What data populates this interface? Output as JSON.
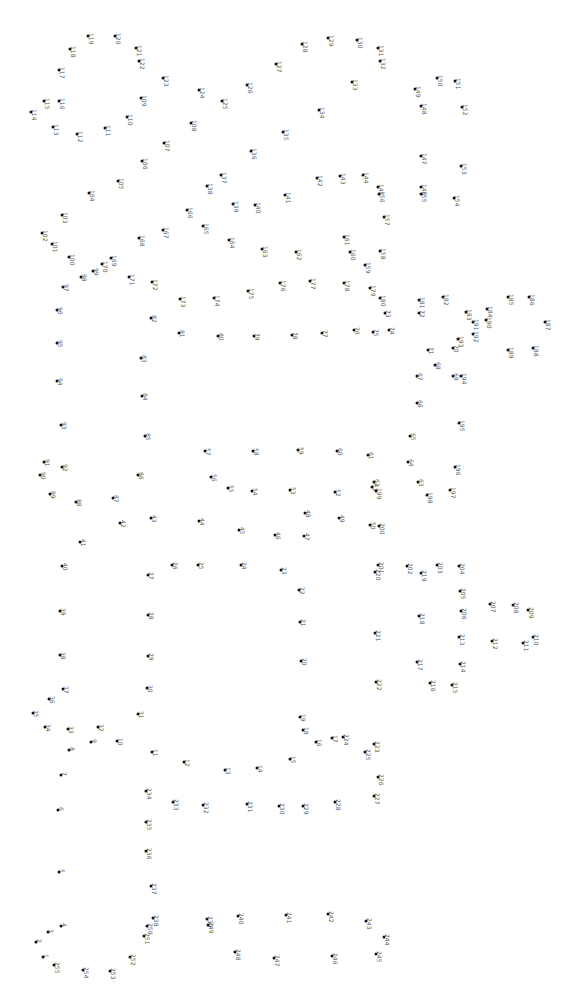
{
  "puzzle": {
    "title": "Connect the dots",
    "rotation_deg": 90,
    "dot_color": "#111111",
    "label_color": "#555555",
    "dots": [
      {
        "n": "1",
        "x": 43,
        "y": 957
      },
      {
        "n": "2",
        "x": 36,
        "y": 942
      },
      {
        "n": "3",
        "x": 48,
        "y": 932
      },
      {
        "n": "4",
        "x": 61,
        "y": 926
      },
      {
        "n": "5",
        "x": 59,
        "y": 872
      },
      {
        "n": "6",
        "x": 58,
        "y": 810
      },
      {
        "n": "7",
        "x": 61,
        "y": 775
      },
      {
        "n": "8",
        "x": 69,
        "y": 750
      },
      {
        "n": "9",
        "x": 91,
        "y": 742
      },
      {
        "n": "10",
        "x": 117,
        "y": 741
      },
      {
        "n": "11",
        "x": 152,
        "y": 752
      },
      {
        "n": "12",
        "x": 184,
        "y": 762
      },
      {
        "n": "13",
        "x": 225,
        "y": 770
      },
      {
        "n": "14",
        "x": 257,
        "y": 768
      },
      {
        "n": "15",
        "x": 290,
        "y": 759
      },
      {
        "n": "16",
        "x": 316,
        "y": 742
      },
      {
        "n": "17",
        "x": 332,
        "y": 738
      },
      {
        "n": "18",
        "x": 303,
        "y": 730
      },
      {
        "n": "19",
        "x": 300,
        "y": 717
      },
      {
        "n": "20",
        "x": 301,
        "y": 661
      },
      {
        "n": "21",
        "x": 300,
        "y": 622
      },
      {
        "n": "22",
        "x": 299,
        "y": 590
      },
      {
        "n": "23",
        "x": 281,
        "y": 570
      },
      {
        "n": "24",
        "x": 241,
        "y": 565
      },
      {
        "n": "25",
        "x": 198,
        "y": 565
      },
      {
        "n": "26",
        "x": 172,
        "y": 565
      },
      {
        "n": "27",
        "x": 148,
        "y": 575
      },
      {
        "n": "28",
        "x": 148,
        "y": 615
      },
      {
        "n": "29",
        "x": 148,
        "y": 656
      },
      {
        "n": "30",
        "x": 147,
        "y": 688
      },
      {
        "n": "31",
        "x": 138,
        "y": 714
      },
      {
        "n": "32",
        "x": 98,
        "y": 727
      },
      {
        "n": "33",
        "x": 68,
        "y": 729
      },
      {
        "n": "34",
        "x": 45,
        "y": 727
      },
      {
        "n": "35",
        "x": 33,
        "y": 713
      },
      {
        "n": "36",
        "x": 49,
        "y": 699
      },
      {
        "n": "37",
        "x": 63,
        "y": 689
      },
      {
        "n": "38",
        "x": 60,
        "y": 655
      },
      {
        "n": "39",
        "x": 60,
        "y": 611
      },
      {
        "n": "40",
        "x": 62,
        "y": 566
      },
      {
        "n": "41",
        "x": 80,
        "y": 542
      },
      {
        "n": "42",
        "x": 120,
        "y": 523
      },
      {
        "n": "43",
        "x": 151,
        "y": 518
      },
      {
        "n": "44",
        "x": 199,
        "y": 521
      },
      {
        "n": "45",
        "x": 239,
        "y": 530
      },
      {
        "n": "46",
        "x": 275,
        "y": 535
      },
      {
        "n": "47",
        "x": 304,
        "y": 536
      },
      {
        "n": "48",
        "x": 305,
        "y": 513
      },
      {
        "n": "49",
        "x": 339,
        "y": 518
      },
      {
        "n": "50",
        "x": 370,
        "y": 525
      },
      {
        "n": "51",
        "x": 372,
        "y": 487
      },
      {
        "n": "52",
        "x": 335,
        "y": 492
      },
      {
        "n": "53",
        "x": 290,
        "y": 490
      },
      {
        "n": "54",
        "x": 252,
        "y": 491
      },
      {
        "n": "55",
        "x": 228,
        "y": 488
      },
      {
        "n": "56",
        "x": 211,
        "y": 477
      },
      {
        "n": "57",
        "x": 205,
        "y": 451
      },
      {
        "n": "58",
        "x": 253,
        "y": 451
      },
      {
        "n": "59",
        "x": 298,
        "y": 450
      },
      {
        "n": "60",
        "x": 337,
        "y": 451
      },
      {
        "n": "61",
        "x": 368,
        "y": 455
      },
      {
        "n": "62",
        "x": 374,
        "y": 482
      },
      {
        "n": "63",
        "x": 418,
        "y": 482
      },
      {
        "n": "64",
        "x": 408,
        "y": 462
      },
      {
        "n": "65",
        "x": 410,
        "y": 436
      },
      {
        "n": "66",
        "x": 417,
        "y": 403
      },
      {
        "n": "67",
        "x": 417,
        "y": 376
      },
      {
        "n": "68",
        "x": 435,
        "y": 365
      },
      {
        "n": "69",
        "x": 453,
        "y": 376
      },
      {
        "n": "70",
        "x": 453,
        "y": 348
      },
      {
        "n": "71",
        "x": 428,
        "y": 350
      },
      {
        "n": "72",
        "x": 419,
        "y": 313
      },
      {
        "n": "73",
        "x": 385,
        "y": 313
      },
      {
        "n": "74",
        "x": 389,
        "y": 330
      },
      {
        "n": "75",
        "x": 373,
        "y": 332
      },
      {
        "n": "76",
        "x": 354,
        "y": 330
      },
      {
        "n": "77",
        "x": 322,
        "y": 333
      },
      {
        "n": "78",
        "x": 292,
        "y": 335
      },
      {
        "n": "79",
        "x": 254,
        "y": 336
      },
      {
        "n": "80",
        "x": 218,
        "y": 336
      },
      {
        "n": "81",
        "x": 179,
        "y": 333
      },
      {
        "n": "82",
        "x": 151,
        "y": 318
      },
      {
        "n": "83",
        "x": 141,
        "y": 358
      },
      {
        "n": "84",
        "x": 142,
        "y": 396
      },
      {
        "n": "85",
        "x": 145,
        "y": 436
      },
      {
        "n": "86",
        "x": 138,
        "y": 475
      },
      {
        "n": "87",
        "x": 113,
        "y": 498
      },
      {
        "n": "88",
        "x": 76,
        "y": 502
      },
      {
        "n": "89",
        "x": 50,
        "y": 494
      },
      {
        "n": "90",
        "x": 40,
        "y": 475
      },
      {
        "n": "91",
        "x": 44,
        "y": 462
      },
      {
        "n": "92",
        "x": 62,
        "y": 467
      },
      {
        "n": "93",
        "x": 61,
        "y": 425
      },
      {
        "n": "94",
        "x": 57,
        "y": 381
      },
      {
        "n": "95",
        "x": 57,
        "y": 343
      },
      {
        "n": "96",
        "x": 57,
        "y": 310
      },
      {
        "n": "97",
        "x": 63,
        "y": 287
      },
      {
        "n": "98",
        "x": 81,
        "y": 277
      },
      {
        "n": "99",
        "x": 93,
        "y": 271
      },
      {
        "n": "100",
        "x": 69,
        "y": 257
      },
      {
        "n": "101",
        "x": 52,
        "y": 244
      },
      {
        "n": "102",
        "x": 42,
        "y": 233
      },
      {
        "n": "103",
        "x": 62,
        "y": 215
      },
      {
        "n": "104",
        "x": 89,
        "y": 193
      },
      {
        "n": "105",
        "x": 118,
        "y": 181
      },
      {
        "n": "106",
        "x": 142,
        "y": 161
      },
      {
        "n": "107",
        "x": 164,
        "y": 143
      },
      {
        "n": "108",
        "x": 191,
        "y": 123
      },
      {
        "n": "109",
        "x": 141,
        "y": 98
      },
      {
        "n": "110",
        "x": 127,
        "y": 117
      },
      {
        "n": "111",
        "x": 105,
        "y": 128
      },
      {
        "n": "112",
        "x": 77,
        "y": 134
      },
      {
        "n": "113",
        "x": 53,
        "y": 127
      },
      {
        "n": "114",
        "x": 31,
        "y": 112
      },
      {
        "n": "115",
        "x": 44,
        "y": 101
      },
      {
        "n": "116",
        "x": 59,
        "y": 101
      },
      {
        "n": "117",
        "x": 59,
        "y": 70
      },
      {
        "n": "118",
        "x": 70,
        "y": 49
      },
      {
        "n": "119",
        "x": 88,
        "y": 36
      },
      {
        "n": "120",
        "x": 115,
        "y": 36
      },
      {
        "n": "121",
        "x": 136,
        "y": 48
      },
      {
        "n": "122",
        "x": 139,
        "y": 61
      },
      {
        "n": "123",
        "x": 163,
        "y": 78
      },
      {
        "n": "124",
        "x": 199,
        "y": 90
      },
      {
        "n": "125",
        "x": 222,
        "y": 101
      },
      {
        "n": "126",
        "x": 247,
        "y": 85
      },
      {
        "n": "127",
        "x": 276,
        "y": 64
      },
      {
        "n": "128",
        "x": 302,
        "y": 44
      },
      {
        "n": "129",
        "x": 328,
        "y": 38
      },
      {
        "n": "130",
        "x": 357,
        "y": 40
      },
      {
        "n": "131",
        "x": 378,
        "y": 48
      },
      {
        "n": "132",
        "x": 380,
        "y": 61
      },
      {
        "n": "133",
        "x": 352,
        "y": 82
      },
      {
        "n": "134",
        "x": 319,
        "y": 110
      },
      {
        "n": "135",
        "x": 283,
        "y": 132
      },
      {
        "n": "136",
        "x": 251,
        "y": 151
      },
      {
        "n": "137",
        "x": 221,
        "y": 175
      },
      {
        "n": "138",
        "x": 207,
        "y": 186
      },
      {
        "n": "139",
        "x": 233,
        "y": 204
      },
      {
        "n": "140",
        "x": 255,
        "y": 205
      },
      {
        "n": "141",
        "x": 285,
        "y": 195
      },
      {
        "n": "142",
        "x": 317,
        "y": 178
      },
      {
        "n": "143",
        "x": 340,
        "y": 176
      },
      {
        "n": "144",
        "x": 363,
        "y": 175
      },
      {
        "n": "145",
        "x": 378,
        "y": 187
      },
      {
        "n": "146",
        "x": 421,
        "y": 187
      },
      {
        "n": "147",
        "x": 421,
        "y": 156
      },
      {
        "n": "148",
        "x": 421,
        "y": 106
      },
      {
        "n": "149",
        "x": 415,
        "y": 89
      },
      {
        "n": "150",
        "x": 437,
        "y": 78
      },
      {
        "n": "151",
        "x": 455,
        "y": 81
      },
      {
        "n": "152",
        "x": 462,
        "y": 107
      },
      {
        "n": "153",
        "x": 461,
        "y": 166
      },
      {
        "n": "154",
        "x": 454,
        "y": 198
      },
      {
        "n": "155",
        "x": 421,
        "y": 194
      },
      {
        "n": "156",
        "x": 379,
        "y": 194
      },
      {
        "n": "157",
        "x": 384,
        "y": 217
      },
      {
        "n": "158",
        "x": 380,
        "y": 251
      },
      {
        "n": "159",
        "x": 365,
        "y": 265
      },
      {
        "n": "160",
        "x": 350,
        "y": 252
      },
      {
        "n": "161",
        "x": 344,
        "y": 237
      },
      {
        "n": "162",
        "x": 296,
        "y": 252
      },
      {
        "n": "163",
        "x": 262,
        "y": 249
      },
      {
        "n": "164",
        "x": 229,
        "y": 240
      },
      {
        "n": "165",
        "x": 203,
        "y": 226
      },
      {
        "n": "166",
        "x": 187,
        "y": 210
      },
      {
        "n": "167",
        "x": 163,
        "y": 230
      },
      {
        "n": "168",
        "x": 139,
        "y": 238
      },
      {
        "n": "169",
        "x": 111,
        "y": 258
      },
      {
        "n": "170",
        "x": 102,
        "y": 264
      },
      {
        "n": "171",
        "x": 129,
        "y": 277
      },
      {
        "n": "172",
        "x": 152,
        "y": 282
      },
      {
        "n": "173",
        "x": 180,
        "y": 299
      },
      {
        "n": "174",
        "x": 214,
        "y": 298
      },
      {
        "n": "175",
        "x": 248,
        "y": 291
      },
      {
        "n": "176",
        "x": 280,
        "y": 283
      },
      {
        "n": "177",
        "x": 310,
        "y": 281
      },
      {
        "n": "178",
        "x": 344,
        "y": 283
      },
      {
        "n": "179",
        "x": 370,
        "y": 288
      },
      {
        "n": "180",
        "x": 380,
        "y": 298
      },
      {
        "n": "181",
        "x": 419,
        "y": 300
      },
      {
        "n": "182",
        "x": 443,
        "y": 297
      },
      {
        "n": "183",
        "x": 466,
        "y": 312
      },
      {
        "n": "184",
        "x": 487,
        "y": 309
      },
      {
        "n": "185",
        "x": 508,
        "y": 297
      },
      {
        "n": "186",
        "x": 529,
        "y": 297
      },
      {
        "n": "187",
        "x": 545,
        "y": 322
      },
      {
        "n": "188",
        "x": 533,
        "y": 348
      },
      {
        "n": "189",
        "x": 508,
        "y": 350
      },
      {
        "n": "190",
        "x": 486,
        "y": 320
      },
      {
        "n": "191",
        "x": 473,
        "y": 322
      },
      {
        "n": "192",
        "x": 473,
        "y": 334
      },
      {
        "n": "193",
        "x": 458,
        "y": 339
      },
      {
        "n": "194",
        "x": 461,
        "y": 376
      },
      {
        "n": "195",
        "x": 459,
        "y": 423
      },
      {
        "n": "196",
        "x": 455,
        "y": 467
      },
      {
        "n": "197",
        "x": 450,
        "y": 490
      },
      {
        "n": "198",
        "x": 427,
        "y": 495
      },
      {
        "n": "199",
        "x": 376,
        "y": 491
      },
      {
        "n": "200",
        "x": 379,
        "y": 526
      },
      {
        "n": "201",
        "x": 378,
        "y": 565
      },
      {
        "n": "202",
        "x": 407,
        "y": 566
      },
      {
        "n": "203",
        "x": 437,
        "y": 565
      },
      {
        "n": "204",
        "x": 459,
        "y": 566
      },
      {
        "n": "205",
        "x": 460,
        "y": 591
      },
      {
        "n": "206",
        "x": 461,
        "y": 611
      },
      {
        "n": "207",
        "x": 490,
        "y": 604
      },
      {
        "n": "208",
        "x": 513,
        "y": 605
      },
      {
        "n": "209",
        "x": 528,
        "y": 610
      },
      {
        "n": "210",
        "x": 533,
        "y": 637
      },
      {
        "n": "211",
        "x": 523,
        "y": 643
      },
      {
        "n": "212",
        "x": 492,
        "y": 641
      },
      {
        "n": "213",
        "x": 459,
        "y": 637
      },
      {
        "n": "214",
        "x": 460,
        "y": 664
      },
      {
        "n": "215",
        "x": 452,
        "y": 685
      },
      {
        "n": "216",
        "x": 430,
        "y": 683
      },
      {
        "n": "217",
        "x": 417,
        "y": 662
      },
      {
        "n": "218",
        "x": 419,
        "y": 616
      },
      {
        "n": "219",
        "x": 421,
        "y": 573
      },
      {
        "n": "220",
        "x": 375,
        "y": 572
      },
      {
        "n": "221",
        "x": 375,
        "y": 633
      },
      {
        "n": "222",
        "x": 376,
        "y": 682
      },
      {
        "n": "223",
        "x": 374,
        "y": 744
      },
      {
        "n": "224",
        "x": 343,
        "y": 737
      },
      {
        "n": "225",
        "x": 365,
        "y": 752
      },
      {
        "n": "226",
        "x": 378,
        "y": 777
      },
      {
        "n": "227",
        "x": 374,
        "y": 796
      },
      {
        "n": "228",
        "x": 335,
        "y": 802
      },
      {
        "n": "229",
        "x": 303,
        "y": 806
      },
      {
        "n": "230",
        "x": 279,
        "y": 806
      },
      {
        "n": "231",
        "x": 247,
        "y": 804
      },
      {
        "n": "232",
        "x": 203,
        "y": 805
      },
      {
        "n": "233",
        "x": 173,
        "y": 802
      },
      {
        "n": "234",
        "x": 146,
        "y": 791
      },
      {
        "n": "235",
        "x": 146,
        "y": 822
      },
      {
        "n": "236",
        "x": 146,
        "y": 851
      },
      {
        "n": "237",
        "x": 151,
        "y": 886
      },
      {
        "n": "238",
        "x": 153,
        "y": 918
      },
      {
        "n": "239",
        "x": 207,
        "y": 919
      },
      {
        "n": "240",
        "x": 238,
        "y": 916
      },
      {
        "n": "241",
        "x": 286,
        "y": 915
      },
      {
        "n": "242",
        "x": 328,
        "y": 914
      },
      {
        "n": "243",
        "x": 366,
        "y": 921
      },
      {
        "n": "244",
        "x": 384,
        "y": 937
      },
      {
        "n": "245",
        "x": 376,
        "y": 954
      },
      {
        "n": "246",
        "x": 332,
        "y": 956
      },
      {
        "n": "247",
        "x": 274,
        "y": 958
      },
      {
        "n": "248",
        "x": 235,
        "y": 952
      },
      {
        "n": "249",
        "x": 208,
        "y": 925
      },
      {
        "n": "250",
        "x": 147,
        "y": 926
      },
      {
        "n": "251",
        "x": 144,
        "y": 936
      },
      {
        "n": "252",
        "x": 130,
        "y": 957
      },
      {
        "n": "253",
        "x": 110,
        "y": 971
      },
      {
        "n": "254",
        "x": 83,
        "y": 970
      },
      {
        "n": "255",
        "x": 54,
        "y": 965
      }
    ]
  }
}
